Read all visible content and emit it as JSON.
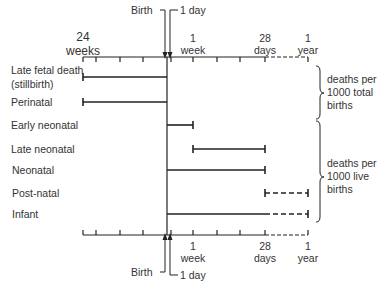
{
  "top_axis": {
    "labels": [
      {
        "text": "24",
        "sub": "weeks"
      },
      {
        "text": "1",
        "sub": "week"
      },
      {
        "text": "28",
        "sub": "days"
      },
      {
        "text": "1",
        "sub": "year"
      }
    ],
    "birth_label": "Birth",
    "one_day_label": "1 day"
  },
  "bottom_axis": {
    "labels": [
      {
        "text": "1",
        "sub": "week"
      },
      {
        "text": "28",
        "sub": "days"
      },
      {
        "text": "1",
        "sub": "year"
      }
    ],
    "birth_label": "Birth",
    "one_day_label": "1 day"
  },
  "rows": [
    {
      "label": "Late fetal death",
      "label2": "(stillbirth)",
      "start": "24 weeks",
      "end": "Birth",
      "style": "solid"
    },
    {
      "label": "Perinatal",
      "start": "24 weeks",
      "end": "1 week",
      "style": "solid"
    },
    {
      "label": "Early neonatal",
      "start": "Birth",
      "end": "1 week",
      "style": "solid"
    },
    {
      "label": "Late neonatal",
      "start": "1 week",
      "end": "28 days",
      "style": "solid"
    },
    {
      "label": "Neonatal",
      "start": "Birth",
      "end": "28 days",
      "style": "solid"
    },
    {
      "label": "Post-natal",
      "start": "28 days",
      "end": "1 year",
      "style": "dashed"
    },
    {
      "label": "Infant",
      "start": "Birth",
      "end": "1 year",
      "style": "solid+dashed"
    }
  ],
  "groups": [
    {
      "text": "deaths per\n1000 total\nbirths",
      "rows": [
        "Late fetal death",
        "Perinatal"
      ]
    },
    {
      "text": "deaths per\n1000 live\nbirths",
      "rows": [
        "Early neonatal",
        "Late neonatal",
        "Neonatal",
        "Post-natal",
        "Infant"
      ]
    }
  ]
}
